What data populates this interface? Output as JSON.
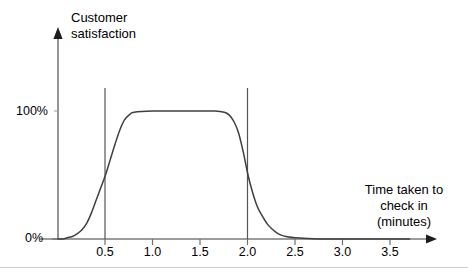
{
  "chart_data": {
    "type": "line",
    "title": "",
    "ylabel": "Customer\nsatisfaction",
    "ylabel_lines": [
      "Customer",
      "satisfaction"
    ],
    "xlabel": "Time taken to\ncheck in\n(minutes)",
    "xlabel_lines": [
      "Time taken to",
      "check in",
      "(minutes)"
    ],
    "xlim": [
      0,
      3.75
    ],
    "ylim": [
      0,
      1.15
    ],
    "grid": false,
    "legend": "none",
    "line_color": "#3f3f3f",
    "axis_color": "#7b7b7b",
    "marker_line_color": "#555555",
    "y_tick_labels": [
      "100%",
      "0%"
    ],
    "y_tick_values": [
      100,
      0
    ],
    "x_tick_labels": [
      "0.5",
      "1.0",
      "1.5",
      "2.0",
      "2.5",
      "3.0",
      "3.5"
    ],
    "x_tick_values": [
      0.5,
      1.0,
      1.5,
      2.0,
      2.5,
      3.0,
      3.5
    ],
    "annotation_lines": [
      0.5,
      2.0
    ],
    "x": [
      0.0,
      0.05,
      0.1,
      0.15,
      0.2,
      0.25,
      0.3,
      0.35,
      0.4,
      0.45,
      0.5,
      0.55,
      0.6,
      0.65,
      0.7,
      0.75,
      0.8,
      1.0,
      1.25,
      1.5,
      1.65,
      1.75,
      1.8,
      1.85,
      1.9,
      1.95,
      2.0,
      2.05,
      2.1,
      2.15,
      2.2,
      2.25,
      2.3,
      2.35,
      2.4,
      2.5,
      2.75,
      3.0,
      3.25,
      3.5,
      3.7
    ],
    "values": [
      0,
      0,
      1,
      2,
      4,
      7,
      12,
      20,
      30,
      40,
      50,
      62,
      74,
      85,
      93,
      97,
      99,
      100,
      100,
      100,
      100,
      99,
      97,
      92,
      83,
      68,
      50,
      36,
      25,
      18,
      12,
      8,
      5,
      3,
      2,
      1,
      0,
      0,
      0,
      0,
      0
    ]
  }
}
